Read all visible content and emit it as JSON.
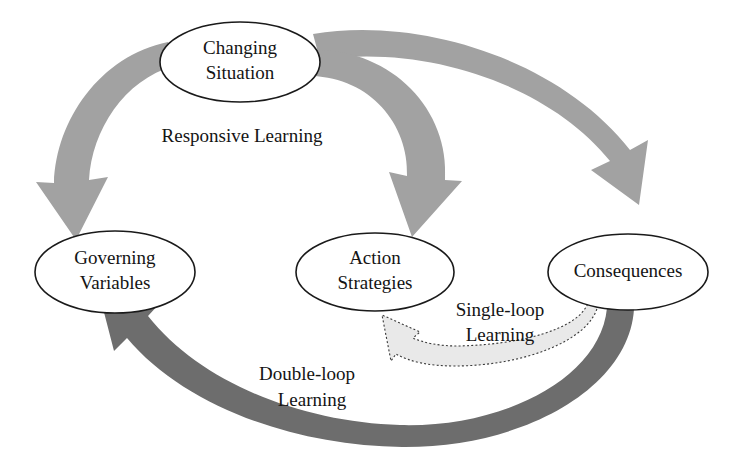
{
  "diagram": {
    "type": "cycle-diagram",
    "background_color": "#ffffff",
    "palette": {
      "node_fill": "#ffffff",
      "node_stroke": "#1a1a1a",
      "text_color": "#141414",
      "arrow_light_gray": "#a2a2a2",
      "arrow_dark_gray": "#6d6d6d",
      "arrow_dotted_fill": "#e9e9e9",
      "arrow_dotted_stroke": "#3a3a3a"
    },
    "nodes": [
      {
        "id": "changing-situation",
        "line1": "Changing",
        "line2": "Situation",
        "cx": 240,
        "cy": 62,
        "rx": 80,
        "ry": 40
      },
      {
        "id": "governing-variables",
        "line1": "Governing",
        "line2": "Variables",
        "cx": 115,
        "cy": 272,
        "rx": 80,
        "ry": 41
      },
      {
        "id": "action-strategies",
        "line1": "Action",
        "line2": "Strategies",
        "cx": 375,
        "cy": 272,
        "rx": 79,
        "ry": 39
      },
      {
        "id": "consequences",
        "line1": "Consequences",
        "line2": "",
        "cx": 628,
        "cy": 272,
        "rx": 80,
        "ry": 38
      }
    ],
    "edge_labels": [
      {
        "id": "responsive-learning",
        "line1": "Responsive Learning",
        "line2": "",
        "x": 242,
        "y": 138
      },
      {
        "id": "single-loop-learning",
        "line1": "Single-loop",
        "line2": "Learning",
        "x": 500,
        "y": 312
      },
      {
        "id": "double-loop-learning",
        "line1": "Double-loop",
        "line2": "Learning",
        "x": 307,
        "y": 376
      }
    ],
    "arrows": [
      {
        "id": "changing-situation-to-governing-variables",
        "style": "solid-light-gray",
        "from": "changing-situation",
        "to": "governing-variables"
      },
      {
        "id": "changing-situation-to-action-strategies",
        "style": "solid-light-gray",
        "from": "changing-situation",
        "to": "action-strategies"
      },
      {
        "id": "changing-situation-to-consequences",
        "style": "solid-light-gray",
        "from": "changing-situation",
        "to": "consequences"
      },
      {
        "id": "consequences-to-action-strategies",
        "style": "dotted-outline",
        "from": "consequences",
        "to": "action-strategies"
      },
      {
        "id": "consequences-to-governing-variables",
        "style": "solid-dark-gray",
        "from": "consequences",
        "to": "governing-variables"
      }
    ]
  }
}
